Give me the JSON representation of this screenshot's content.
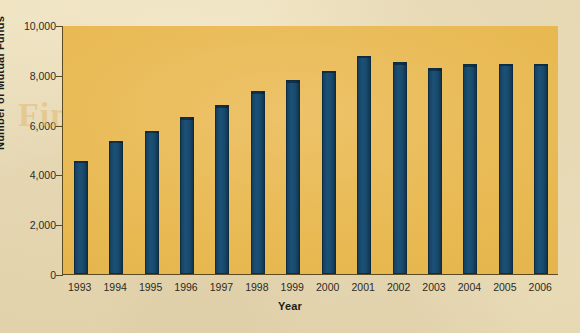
{
  "chart_data": {
    "type": "bar",
    "title": "",
    "xlabel": "Year",
    "ylabel": "Number of Mutual Funds",
    "categories": [
      "1993",
      "1994",
      "1995",
      "1996",
      "1997",
      "1998",
      "1999",
      "2000",
      "2001",
      "2002",
      "2003",
      "2004",
      "2005",
      "2006"
    ],
    "values": [
      4558,
      5357,
      5761,
      6293,
      6778,
      7343,
      7791,
      8155,
      8756,
      8512,
      8256,
      8416,
      8451,
      8454
    ],
    "ylim": [
      0,
      10000
    ],
    "ytick_values": [
      0,
      2000,
      4000,
      6000,
      8000,
      10000
    ],
    "ytick_labels": [
      "0",
      "2,000",
      "4,000",
      "6,000",
      "8,000",
      "10,000"
    ],
    "grid": false,
    "legend": null,
    "series": [
      {
        "name": "Number of Mutual Funds",
        "values": [
          4558,
          5357,
          5761,
          6293,
          6778,
          7343,
          7791,
          8155,
          8756,
          8512,
          8256,
          8416,
          8451,
          8454
        ]
      }
    ]
  },
  "colors": {
    "bar": "#194a6c",
    "plot_background": "#e8b951",
    "page_background": "#ece0bd",
    "axis": "#5b4a22",
    "text": "#1c1c18"
  },
  "watermark": {
    "line_a": "Financial Markets",
    "line_b": "Chapter",
    "line_c": "Funds"
  }
}
